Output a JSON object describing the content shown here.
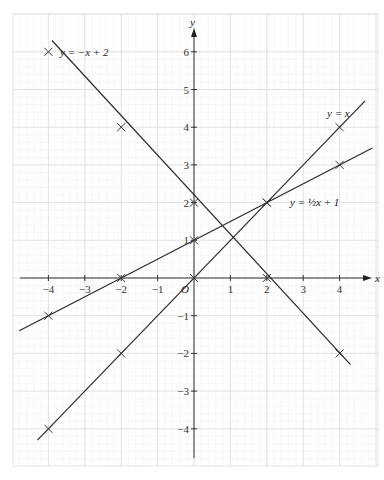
{
  "chart_data": {
    "type": "line",
    "title": "",
    "xlabel": "x",
    "ylabel": "y",
    "origin_label": "O",
    "xlim": [
      -5,
      5
    ],
    "ylim": [
      -5,
      6.5
    ],
    "grid": true,
    "minor_grid": true,
    "x_ticks": [
      -4,
      -3,
      -2,
      -1,
      1,
      2,
      3,
      4
    ],
    "x_tick_labels": [
      "−4",
      "−3",
      "−2",
      "−1",
      "1",
      "2",
      "3",
      "4"
    ],
    "y_ticks": [
      -4,
      -3,
      -2,
      -1,
      1,
      2,
      3,
      4,
      5,
      6
    ],
    "y_tick_labels": [
      "−4",
      "−3",
      "−2",
      "−1",
      "1",
      "2",
      "3",
      "4",
      "5",
      "6"
    ],
    "series": [
      {
        "name": "y = −x + 2",
        "label": "y = −x + 2",
        "line": {
          "x1": -3.9,
          "y1": 6.3,
          "x2": 4.3,
          "y2": -2.3
        },
        "points": [
          {
            "x": -4,
            "y": 6
          },
          {
            "x": -2,
            "y": 4
          },
          {
            "x": 0,
            "y": 2
          },
          {
            "x": 2,
            "y": 0
          },
          {
            "x": 4,
            "y": -2
          }
        ]
      },
      {
        "name": "y = x",
        "label": "y = x",
        "line": {
          "x1": -4.3,
          "y1": -4.3,
          "x2": 4.7,
          "y2": 4.7
        },
        "points": [
          {
            "x": -4,
            "y": -4
          },
          {
            "x": -2,
            "y": -2
          },
          {
            "x": 0,
            "y": 0
          },
          {
            "x": 2,
            "y": 2
          },
          {
            "x": 4,
            "y": 4
          }
        ]
      },
      {
        "name": "y = ½x + 1",
        "label": "y = ½x + 1",
        "line": {
          "x1": -4.8,
          "y1": -1.4,
          "x2": 4.9,
          "y2": 3.45
        },
        "points": [
          {
            "x": -4,
            "y": -1
          },
          {
            "x": -2,
            "y": 0
          },
          {
            "x": 0,
            "y": 1
          },
          {
            "x": 2,
            "y": 2
          },
          {
            "x": 4,
            "y": 3
          }
        ]
      }
    ],
    "annotations": [
      {
        "text": "y = −x + 2",
        "near": {
          "x": -4,
          "y": 6
        }
      },
      {
        "text": "y = x",
        "near": {
          "x": 3.8,
          "y": 4.4
        }
      },
      {
        "text": "y = ½x + 1",
        "near": {
          "x": 2.6,
          "y": 2
        }
      }
    ]
  }
}
